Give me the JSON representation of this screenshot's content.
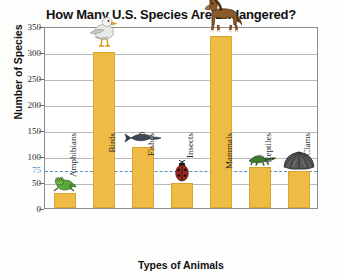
{
  "chart_data": {
    "type": "bar",
    "title": "How Many U.S. Species Are Endangered?",
    "xlabel": "Types of Animals",
    "ylabel": "Number of Species",
    "categories": [
      "Amphibians",
      "Birds",
      "Fishes",
      "Insects",
      "Mammals",
      "Reptiles",
      "Clams"
    ],
    "values": [
      28,
      300,
      118,
      48,
      330,
      78,
      72
    ],
    "ylim": [
      0,
      350
    ],
    "yticks": [
      0,
      50,
      100,
      150,
      200,
      250,
      300,
      350
    ],
    "ytick_labels": [
      "0",
      "50",
      "100",
      "150",
      "200",
      "250",
      "300",
      "350"
    ],
    "grid": true,
    "legend": false,
    "bar_color": "#eebb44",
    "bar_edge_color": "#d8a52e",
    "reference_line": {
      "value": 75,
      "label": "75",
      "color": "#4f92c8",
      "style": "dashed"
    },
    "icons": [
      {
        "category": "Amphibians",
        "name": "frog-icon"
      },
      {
        "category": "Birds",
        "name": "seagull-icon"
      },
      {
        "category": "Fishes",
        "name": "fish-icon"
      },
      {
        "category": "Insects",
        "name": "ladybug-icon"
      },
      {
        "category": "Mammals",
        "name": "horse-icon"
      },
      {
        "category": "Reptiles",
        "name": "turtle-icon"
      },
      {
        "category": "Clams",
        "name": "clam-icon"
      }
    ]
  }
}
